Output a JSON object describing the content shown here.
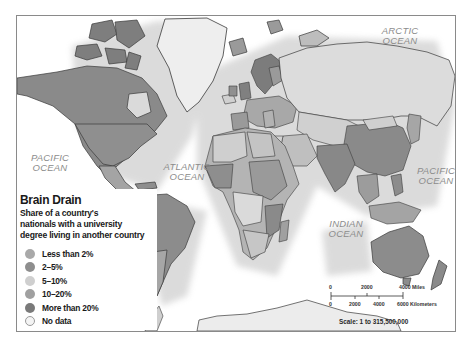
{
  "map": {
    "title": "Brain Drain",
    "subtitle_lines": [
      "Share of a country's",
      "nationals with a university",
      "degree living in another country"
    ],
    "ocean_labels": [
      {
        "id": "arctic",
        "line1": "ARCTIC",
        "line2": "OCEAN"
      },
      {
        "id": "pacific-west",
        "line1": "PACIFIC",
        "line2": "OCEAN"
      },
      {
        "id": "atlantic",
        "line1": "ATLANTIC",
        "line2": "OCEAN"
      },
      {
        "id": "pacific-east",
        "line1": "PACIFIC",
        "line2": "OCEAN"
      },
      {
        "id": "indian",
        "line1": "INDIAN",
        "line2": "OCEAN"
      }
    ],
    "legend": {
      "items": [
        {
          "label": "Less than 2%",
          "color": "#a9a9a9"
        },
        {
          "label": "2–5%",
          "color": "#8e8e8e"
        },
        {
          "label": "5–10%",
          "color": "#cfcfcf"
        },
        {
          "label": "10–20%",
          "color": "#a0a0a0"
        },
        {
          "label": "More than 20%",
          "color": "#7a7a7a"
        },
        {
          "label": "No data",
          "color": "#f4f4f4"
        }
      ]
    },
    "scale": {
      "miles_ticks": [
        "0",
        "2000",
        "4000 Miles"
      ],
      "km_ticks": [
        "0",
        "2000",
        "4000",
        "6000 Kilometers"
      ],
      "ratio": "Scale: 1 to 315,500,000"
    }
  }
}
